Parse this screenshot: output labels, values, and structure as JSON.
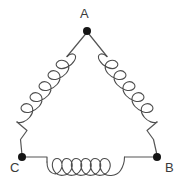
{
  "diagram": {
    "type": "delta-connection-coils",
    "title": "",
    "canvas": {
      "width": 183,
      "height": 186,
      "background": "#ffffff"
    },
    "style": {
      "coil_stroke": "#4d4d4d",
      "lead_stroke": "#555555",
      "node_fill": "#151515",
      "label_color": "#3a3a3a",
      "stroke_width": 1.1,
      "node_radius": 3.6,
      "label_font_size": 13
    },
    "nodes": [
      {
        "id": "A",
        "label": "A",
        "x": 87,
        "y": 31,
        "label_x": 80,
        "label_y": 7
      },
      {
        "id": "C",
        "label": "C",
        "x": 22,
        "y": 157,
        "label_x": 10,
        "label_y": 161
      },
      {
        "id": "B",
        "label": "B",
        "x": 157,
        "y": 157,
        "label_x": 165,
        "label_y": 161
      }
    ],
    "coils": [
      {
        "id": "coil-ac",
        "from": "A",
        "to": "C",
        "loops": 5,
        "orientation": "diagonal-left"
      },
      {
        "id": "coil-ab",
        "from": "A",
        "to": "B",
        "loops": 5,
        "orientation": "diagonal-right"
      },
      {
        "id": "coil-cb",
        "from": "C",
        "to": "B",
        "loops": 5,
        "orientation": "horizontal"
      }
    ]
  }
}
